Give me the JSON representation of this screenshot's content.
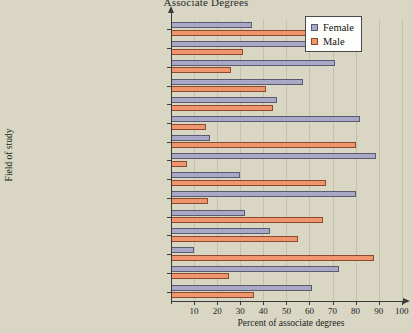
{
  "chart_data": {
    "type": "bar",
    "orientation": "horizontal",
    "title": "Associate Degrees",
    "xlabel": "Percent of associate degrees",
    "ylabel": "Field of study",
    "xlim": [
      0,
      104
    ],
    "xticks": [
      10,
      20,
      30,
      40,
      50,
      60,
      70,
      80,
      90,
      100
    ],
    "grid": true,
    "legend_position": "top-right",
    "categories": [
      "Agriculture and Natural Resources",
      "Biological and Biomedical Sciences",
      "Accounting",
      "Business/Commerce",
      "Communication/Journalism",
      "Education",
      "Engineering",
      "Family and Consumer Sciences",
      "Emergency Medical Technician",
      "Legal Professions",
      "Mathematics and Statistics",
      "Physical Sciences",
      "Precision Production",
      "Psychology",
      "Social Sciences"
    ],
    "series": [
      {
        "name": "Female",
        "color": "#a9a8c6",
        "values": [
          35,
          63,
          71,
          57,
          46,
          82,
          17,
          89,
          30,
          80,
          32,
          43,
          10,
          73,
          61
        ]
      },
      {
        "name": "Male",
        "color": "#f0966f",
        "values": [
          62,
          31,
          26,
          41,
          44,
          15,
          80,
          7,
          67,
          16,
          66,
          55,
          88,
          25,
          36
        ]
      }
    ]
  },
  "legend": {
    "items": [
      {
        "label": "Female"
      },
      {
        "label": "Male"
      }
    ]
  }
}
